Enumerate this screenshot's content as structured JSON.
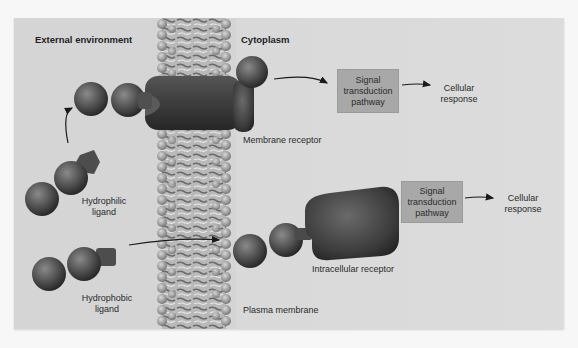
{
  "diagram": {
    "regions": {
      "external": "External environment",
      "cytoplasm": "Cytoplasm"
    },
    "structures": {
      "membrane_receptor": "Membrane receptor",
      "intracellular_receptor": "Intracellular receptor",
      "plasma_membrane": "Plasma membrane"
    },
    "ligands": {
      "hydrophilic": {
        "line1": "Hydrophilic",
        "line2": "ligand"
      },
      "hydrophobic": {
        "line1": "Hydrophobic",
        "line2": "ligand"
      }
    },
    "pathway_top": {
      "box": {
        "line1": "Signal",
        "line2": "transduction",
        "line3": "pathway"
      },
      "response": {
        "line1": "Cellular",
        "line2": "response"
      }
    },
    "pathway_bottom": {
      "box": {
        "line1": "Signal",
        "line2": "transduction",
        "line3": "pathway"
      },
      "response": {
        "line1": "Cellular",
        "line2": "response"
      }
    },
    "colors": {
      "background": "#d5d5d5",
      "box_fill": "#a8a8a8",
      "receptor": "#3c3c3c",
      "ligand_sphere": "#5a5a5a",
      "arrow": "#1a1a1a"
    }
  }
}
